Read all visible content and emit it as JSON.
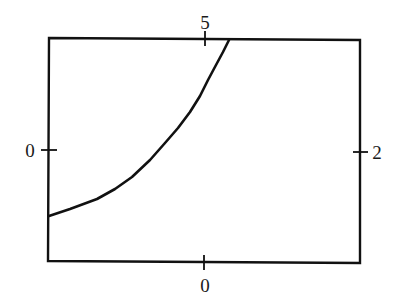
{
  "chart_data": {
    "type": "line",
    "title": "",
    "xlabel": "",
    "ylabel": "",
    "grid": false,
    "legend": null,
    "frame": {
      "left_px": 49,
      "right_px": 360,
      "top_px": 39,
      "bottom_px": 262
    },
    "axes": {
      "top": {
        "tick_labels": [
          "5"
        ],
        "tick_px": [
          205
        ]
      },
      "bottom": {
        "tick_labels": [
          "0"
        ],
        "tick_px": [
          204
        ]
      },
      "left": {
        "tick_labels": [
          "0"
        ],
        "tick_px": [
          150
        ]
      },
      "right": {
        "tick_labels": [
          "2"
        ],
        "tick_px": [
          152
        ]
      }
    },
    "series": [
      {
        "name": "curve",
        "color": "#111111",
        "description": "Monotonically increasing convex curve starting at the left edge below center and exiting through the top edge just right of the top tick",
        "points_px": [
          [
            49,
            216
          ],
          [
            70,
            209
          ],
          [
            97,
            199
          ],
          [
            115,
            189
          ],
          [
            132,
            177
          ],
          [
            150,
            160
          ],
          [
            165,
            143
          ],
          [
            178,
            128
          ],
          [
            190,
            112
          ],
          [
            200,
            96
          ],
          [
            208,
            80
          ],
          [
            216,
            65
          ],
          [
            223,
            52
          ],
          [
            229,
            40
          ]
        ]
      }
    ]
  },
  "labels": {
    "top_tick": "5",
    "bottom_tick": "0",
    "left_tick": "0",
    "right_tick": "2"
  },
  "colors": {
    "stroke": "#111111",
    "background": "#ffffff"
  }
}
